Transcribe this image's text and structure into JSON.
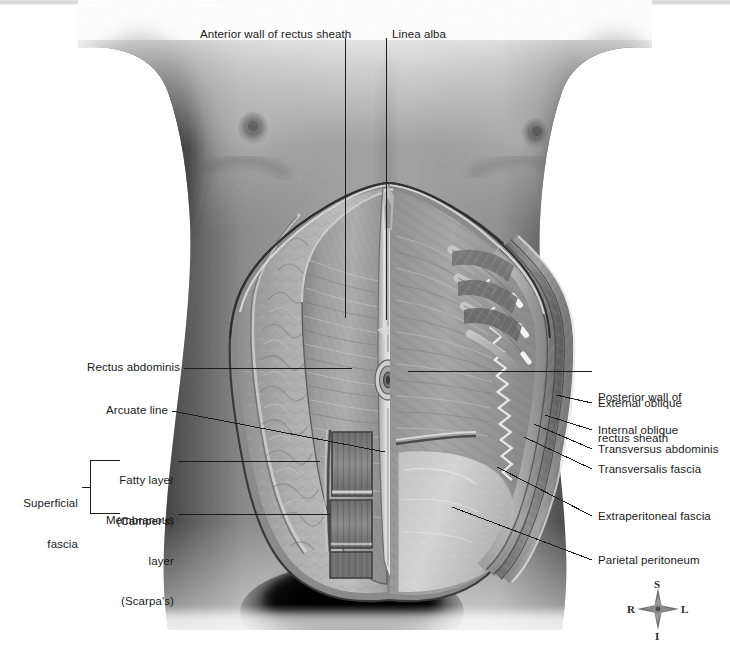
{
  "figure": {
    "style": "grayscale medical illustration over photographic torso"
  },
  "labels_top": [
    {
      "id": "anterior-wall-rectus-sheath",
      "text": "Anterior wall of rectus sheath",
      "x": 200,
      "y": 28,
      "align": "left"
    },
    {
      "id": "linea-alba",
      "text": "Linea alba",
      "x": 392,
      "y": 28,
      "align": "left"
    }
  ],
  "labels_left": [
    {
      "id": "rectus-abdominis",
      "text": "Rectus abdominis",
      "x": 88,
      "y": 361,
      "align": "right"
    },
    {
      "id": "arcuate-line",
      "text": "Arcuate line",
      "x": 113,
      "y": 404,
      "align": "right"
    },
    {
      "id": "fatty-layer",
      "line1": "Fatty layer",
      "line2": "(Camper's)",
      "x": 108,
      "y": 447,
      "align": "right"
    },
    {
      "id": "membranous-layer",
      "line1": "Membranous",
      "line2": "layer",
      "line3": "(Scarpa's)",
      "x": 108,
      "y": 490,
      "align": "right"
    },
    {
      "id": "superficial-fascia",
      "line1": "Superficial",
      "line2": "fascia",
      "x": 30,
      "y": 470,
      "align": "right"
    }
  ],
  "labels_right": [
    {
      "id": "posterior-wall-rectus-sheath",
      "line1": "Posterior wall of",
      "line2": "rectus sheath",
      "x": 598,
      "y": 364
    },
    {
      "id": "external-oblique",
      "text": "External oblique",
      "x": 598,
      "y": 397
    },
    {
      "id": "internal-oblique",
      "text": "Internal oblique",
      "x": 598,
      "y": 424
    },
    {
      "id": "transversus-abdominis",
      "text": "Transversus abdominis",
      "x": 598,
      "y": 443
    },
    {
      "id": "transversalis-fascia",
      "text": "Transversalis fascia",
      "x": 598,
      "y": 463
    },
    {
      "id": "extraperitoneal-fascia",
      "text": "Extraperitoneal fascia",
      "x": 598,
      "y": 510
    },
    {
      "id": "parietal-peritoneum",
      "text": "Parietal peritoneum",
      "x": 598,
      "y": 554
    }
  ],
  "bracket": {
    "id": "superficial-fascia-bracket",
    "label": "Superficial fascia",
    "groups": [
      "Fatty layer (Camper's)",
      "Membranous layer (Scarpa's)"
    ]
  },
  "compass": {
    "id": "orientation-compass",
    "superior": "S",
    "inferior": "I",
    "right": "R",
    "left": "L",
    "cx": 658,
    "cy": 609
  },
  "colors": {
    "label_text": "#1a1a1a",
    "leader_line": "#1c1c1c",
    "skin_mid": "#8f8f8f",
    "skin_dark": "#2a2a2a",
    "skin_light": "#c8c8c8",
    "sheath_gray": "#9a9a9a",
    "muscle_gray": "#7d7d7d",
    "fat_gray": "#b4b4b4",
    "peritoneum_light": "#d6d6d6",
    "background": "#ffffff",
    "topbar": "#d8d8d8"
  }
}
